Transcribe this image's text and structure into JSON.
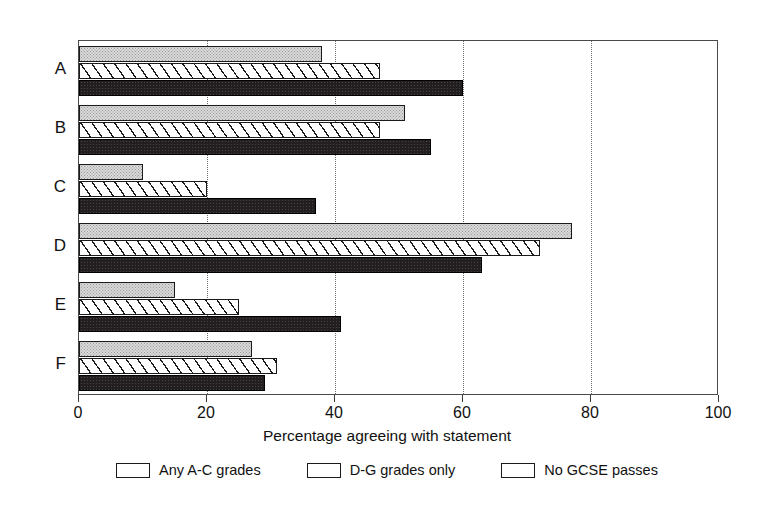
{
  "chart_data": {
    "type": "bar",
    "orientation": "horizontal",
    "title": "",
    "xlabel": "Percentage agreeing with statement",
    "ylabel": "",
    "xlim": [
      0,
      100
    ],
    "xticks": [
      0,
      20,
      40,
      60,
      80,
      100
    ],
    "grid": "vertical dotted gridlines at 20, 40, 60, 80",
    "legend_position": "bottom",
    "categories": [
      "A",
      "B",
      "C",
      "D",
      "E",
      "F"
    ],
    "series": [
      {
        "name": "Any A-C grades",
        "pattern": "light-stipple",
        "color": "#d9d9d9",
        "values": [
          38,
          51,
          10,
          77,
          15,
          27
        ]
      },
      {
        "name": "D-G grades only",
        "pattern": "diagonal-hatch",
        "color": "#ffffff",
        "values": [
          47,
          47,
          20,
          72,
          25,
          31
        ]
      },
      {
        "name": "No GCSE passes",
        "pattern": "solid-black",
        "color": "#231f20",
        "values": [
          60,
          55,
          37,
          63,
          41,
          29
        ]
      }
    ]
  }
}
